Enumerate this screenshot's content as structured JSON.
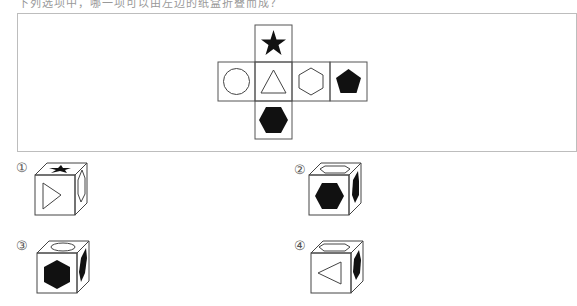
{
  "header": {
    "text": "下列选项中，哪一项可以由左边的纸盒折叠而成？"
  },
  "net": {
    "faces": [
      {
        "position": "top",
        "shape": "star",
        "fill": "black"
      },
      {
        "position": "middle-1",
        "shape": "circle",
        "fill": "white"
      },
      {
        "position": "middle-2",
        "shape": "triangle",
        "fill": "white"
      },
      {
        "position": "middle-3",
        "shape": "hexagon",
        "fill": "white"
      },
      {
        "position": "middle-4",
        "shape": "pentagon",
        "fill": "black"
      },
      {
        "position": "bottom",
        "shape": "hexagon",
        "fill": "black"
      }
    ]
  },
  "options": [
    {
      "label": "①",
      "top": "star (black)",
      "front": "triangle pointing right",
      "side": "hexagon (white)"
    },
    {
      "label": "②",
      "top": "hexagon (white)",
      "front": "hexagon (black)",
      "side": "hexagon (black)"
    },
    {
      "label": "③",
      "top": "circle",
      "front": "hexagon (black)",
      "side": "hexagon (black)"
    },
    {
      "label": "④",
      "top": "hexagon (white)",
      "front": "triangle pointing left",
      "side": "hexagon (black)"
    }
  ]
}
